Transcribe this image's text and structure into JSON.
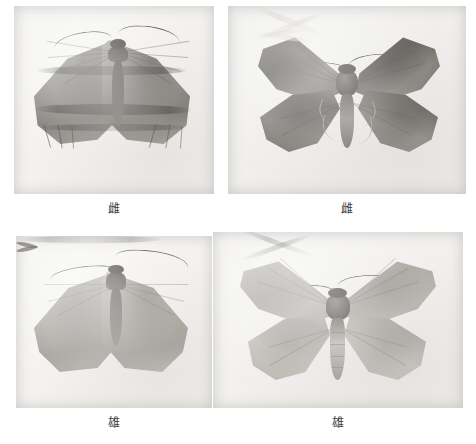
{
  "plate": {
    "background_color": "#ffffff",
    "layout": "2x2-grid",
    "figure_count": 4
  },
  "figures": [
    {
      "id": "figure-top-left",
      "position": "top-left",
      "caption": "雌",
      "caption_meaning": "female",
      "subject": "moth specimen, dorsal view, wings folded roof-like",
      "photo_tone": "grayscale",
      "background_color": "#f3f2f0",
      "wing_color": "#85827c"
    },
    {
      "id": "figure-top-right",
      "position": "top-right",
      "caption": "雌",
      "caption_meaning": "female",
      "subject": "moth specimen, pinned, wings spread",
      "photo_tone": "grayscale",
      "background_color": "#f0efed",
      "wing_color": "#56534e"
    },
    {
      "id": "figure-bottom-left",
      "position": "bottom-left",
      "caption": "雄",
      "caption_meaning": "male",
      "subject": "moth specimen, dorsal view, wings folded",
      "photo_tone": "grayscale",
      "background_color": "#f4f3f1",
      "wing_color": "#a9a69f"
    },
    {
      "id": "figure-bottom-right",
      "position": "bottom-right",
      "caption": "雄",
      "caption_meaning": "male",
      "subject": "moth specimen, pinned, wings spread",
      "photo_tone": "grayscale",
      "background_color": "#f2f1ef",
      "wing_color": "#a8a59f"
    }
  ]
}
